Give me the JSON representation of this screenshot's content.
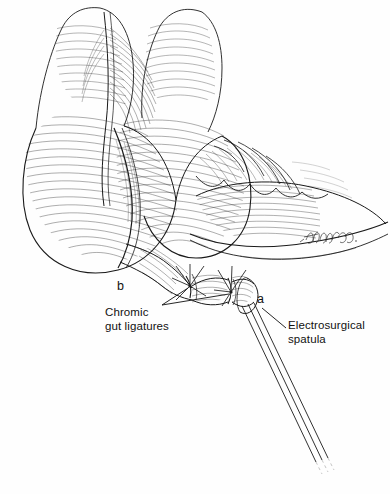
{
  "figure": {
    "kind": "surgical-line-illustration",
    "background_color": "#fefefe",
    "ink_color": "#1a1a1a"
  },
  "labels": {
    "ligatures": "Chromic\ngut ligatures",
    "spatula": "Electrosurgical\nspatula",
    "marker_a": "a",
    "marker_b": "b"
  },
  "signature": {
    "text": "Frondo"
  },
  "anatomy": {
    "parts": [
      "cecum-haustrum-upper",
      "cecum-haustrum-lower",
      "colon-taenia",
      "epiploic-appendages",
      "appendiceal-pedicle",
      "appendiceal-stump"
    ]
  },
  "instrument": {
    "name": "electrosurgical-spatula",
    "parts": [
      "spatula-blade-tip",
      "spatula-shaft"
    ]
  },
  "ligatures": {
    "knots": [
      "proximal-knot",
      "distal-knot"
    ],
    "count": 2
  }
}
